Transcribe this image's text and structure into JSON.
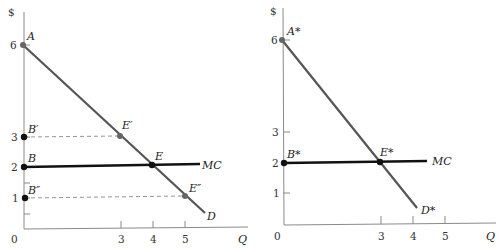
{
  "diagram": {
    "left_panel": {
      "y_axis_label": "$",
      "x_axis_label": "Q",
      "origin_label": "0",
      "y_ticks": [
        "6",
        "3",
        "2",
        "1"
      ],
      "x_ticks": [
        "3",
        "4",
        "5"
      ],
      "points": {
        "A": "A",
        "B_prime": "B′",
        "B": "B",
        "B_double_prime": "B″",
        "E_prime": "E′",
        "E": "E",
        "E_double_prime": "E″"
      },
      "curves": {
        "mc": "MC",
        "demand": "D"
      }
    },
    "right_panel": {
      "y_axis_label": "$",
      "x_axis_label": "Q",
      "origin_label": "0",
      "y_ticks": [
        "6",
        "3",
        "2",
        "1"
      ],
      "x_ticks": [
        "3",
        "4",
        "5"
      ],
      "points": {
        "A_star": "A*",
        "B_star": "B*",
        "E_star": "E*"
      },
      "curves": {
        "mc": "MC",
        "demand": "D*"
      }
    }
  }
}
